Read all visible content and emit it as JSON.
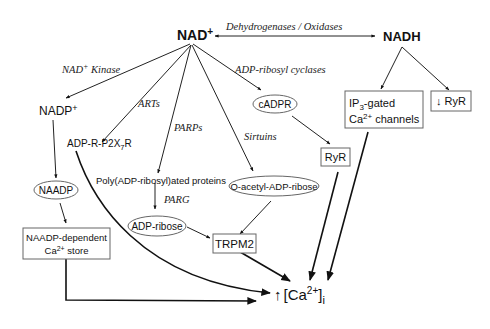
{
  "diagram": {
    "nodes": {
      "nad": {
        "label": "NAD",
        "sup": "+"
      },
      "nadh": {
        "label": "NADH"
      },
      "nadp": {
        "label": "NADP",
        "sup": "+"
      },
      "adp_r_p2x7r": {
        "pre": "ADP-R-P2X",
        "sub": "7",
        "post": "R"
      },
      "cadpr": {
        "label": "cADPR"
      },
      "ip3_gated": {
        "line1_pre": "IP",
        "line1_sub": "3",
        "line1_post": "-gated",
        "line2_pre": "Ca",
        "line2_sup": "2+",
        "line2_post": " channels"
      },
      "down_ryr": {
        "label": "↓ RyR"
      },
      "ryr": {
        "label": "RyR"
      },
      "poly_adp": {
        "label": "Poly(ADP-ribosyl)ated proteins"
      },
      "naadp": {
        "label": "NAADP"
      },
      "o_acetyl": {
        "label": "O-acetyl-ADP-ribose"
      },
      "adp_ribose": {
        "label": "ADP-ribose"
      },
      "trpm2": {
        "label": "TRPM2"
      },
      "naadp_store": {
        "line1": "NAADP-dependent",
        "line2_pre": "Ca",
        "line2_sup": "2+",
        "line2_post": " store"
      },
      "ca_i": {
        "arrow": "↑",
        "pre": "[Ca",
        "sup": "2+",
        "post": "]",
        "sub": "i"
      }
    },
    "edge_labels": {
      "dehydrogenases": "Dehydrogenases / Oxidases",
      "nad_kinase_pre": "NAD",
      "nad_kinase_sup": "+",
      "nad_kinase_post": " Kinase",
      "arts": "ARTs",
      "parps": "PARPs",
      "sirtuins": "Sirtuins",
      "adp_ribosyl_cyclases": "ADP-ribosyl cyclases",
      "parg": "PARG"
    }
  }
}
